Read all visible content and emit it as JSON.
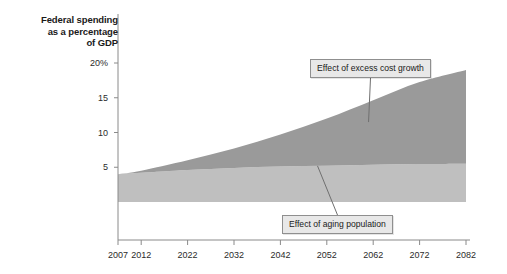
{
  "chart_data": {
    "type": "area",
    "title": "Federal spending as a percentage of GDP",
    "title_lines": [
      "Federal spending",
      "as a percentage",
      "of GDP"
    ],
    "xlabel": "",
    "ylabel": "Federal spending as a percentage of GDP",
    "xlim": [
      2007,
      2082
    ],
    "ylim": [
      0,
      21.5
    ],
    "grid": false,
    "legend_position": "none",
    "stacked": true,
    "x": [
      2007,
      2012,
      2022,
      2032,
      2042,
      2052,
      2062,
      2072,
      2082
    ],
    "series": [
      {
        "name": "Effect of aging population",
        "color": "#bfbfbf",
        "values": [
          4.0,
          4.2,
          4.6,
          4.9,
          5.1,
          5.2,
          5.35,
          5.45,
          5.5
        ]
      },
      {
        "name": "Effect of excess cost growth",
        "color": "#9a9a9a",
        "values": [
          0.0,
          0.3,
          1.4,
          2.8,
          4.6,
          6.8,
          9.3,
          11.8,
          13.5
        ]
      }
    ],
    "total_top": [
      4.0,
      4.5,
      6.0,
      7.7,
      9.7,
      12.0,
      14.65,
      17.25,
      19.0
    ],
    "xticks": [
      2007,
      2012,
      2022,
      2032,
      2042,
      2052,
      2062,
      2072,
      2082
    ],
    "xtick_labels": [
      "2007",
      "2012",
      "2022",
      "2032",
      "2042",
      "2052",
      "2062",
      "2072",
      "2082"
    ],
    "yticks": [
      5,
      10,
      15,
      20
    ],
    "ytick_labels": [
      "5",
      "10",
      "15",
      "20%"
    ],
    "annotations": [
      {
        "text": "Effect of excess cost growth",
        "target_year": 2061,
        "target_value": 11.5,
        "box_x": 310,
        "box_y": 59
      },
      {
        "text": "Effect of aging population",
        "target_year": 2050,
        "target_value": 5.2,
        "box_x": 282,
        "box_y": 215
      }
    ],
    "colors": {
      "excess_cost_growth": "#9a9a9a",
      "aging_population": "#bfbfbf",
      "axis": "#8a8a8a",
      "text": "#1a1a1a",
      "callout_bg": "#e8e8e8",
      "callout_border": "#8f8f8f",
      "background": "#ffffff"
    }
  }
}
